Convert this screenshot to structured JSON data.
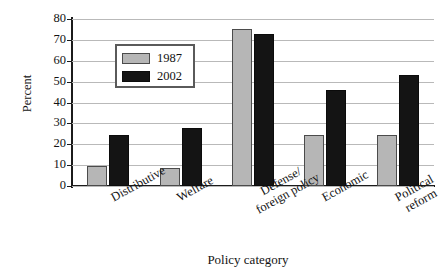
{
  "chart_data": {
    "type": "bar",
    "title": "",
    "xlabel": "Policy category",
    "ylabel": "Percent",
    "categories": [
      "Distributive",
      "Welfare",
      "Defense/\nforeign policy",
      "Economic",
      "Political\nreform"
    ],
    "category_lines": [
      [
        "Distributive"
      ],
      [
        "Welfare"
      ],
      [
        "Defense/",
        "foreign policy"
      ],
      [
        "Economic"
      ],
      [
        "Political",
        "reform"
      ]
    ],
    "series": [
      {
        "name": "1987",
        "color": "#b6b6b6",
        "values": [
          9.5,
          8.5,
          75,
          24.5,
          24.5
        ]
      },
      {
        "name": "2002",
        "color": "#141414",
        "values": [
          24.5,
          28,
          73,
          46,
          53
        ]
      }
    ],
    "ylim": [
      0,
      80
    ],
    "yticks": [
      0,
      10,
      20,
      30,
      40,
      50,
      60,
      70,
      80
    ],
    "ytick_labels": [
      "0",
      "10",
      "20",
      "30",
      "40",
      "50",
      "60",
      "70",
      "80"
    ],
    "grid": true,
    "legend_position": "upper-left-inside"
  }
}
